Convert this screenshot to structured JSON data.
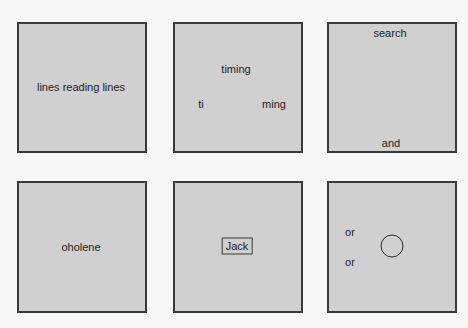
{
  "panels": [
    {
      "id": "panel-1",
      "labels": [
        {
          "text": "lines reading lines",
          "x": 81,
          "y": 87
        }
      ]
    },
    {
      "id": "panel-2",
      "labels": [
        {
          "text": "timing",
          "x": 236,
          "y": 69
        },
        {
          "text": "ti",
          "x": 201,
          "y": 104
        },
        {
          "text": "ming",
          "x": 274,
          "y": 104
        }
      ]
    },
    {
      "id": "panel-3",
      "labels": [
        {
          "text": "search",
          "x": 390,
          "y": 33
        },
        {
          "text": "and",
          "x": 391,
          "y": 143
        }
      ]
    },
    {
      "id": "panel-4",
      "labels": [
        {
          "text": "oholene",
          "x": 81,
          "y": 247
        }
      ]
    },
    {
      "id": "panel-5",
      "labels": [
        {
          "text": "Jack",
          "x": 237,
          "y": 246,
          "boxed": true
        }
      ]
    },
    {
      "id": "panel-6",
      "labels": [
        {
          "text": "or",
          "x": 350,
          "y": 232
        },
        {
          "text": "or",
          "x": 350,
          "y": 262
        }
      ],
      "shapes": [
        {
          "type": "circle",
          "cx": 392,
          "cy": 246,
          "r": 11
        }
      ]
    }
  ],
  "colors": {
    "background": "#f7f7f7",
    "panel_fill": "#d0d0d0",
    "panel_border": "#3a3a3a",
    "text": "#222222"
  }
}
